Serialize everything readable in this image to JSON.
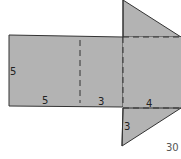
{
  "diagram": {
    "type": "net-of-triangular-prism",
    "fill_color": "#b3b3b3",
    "stroke_color": "#333333",
    "labels": {
      "left_height": "5",
      "bottom_left": "5",
      "bottom_middle": "3",
      "triangle_base": "4",
      "triangle_side": "3"
    },
    "page_number": "30"
  }
}
